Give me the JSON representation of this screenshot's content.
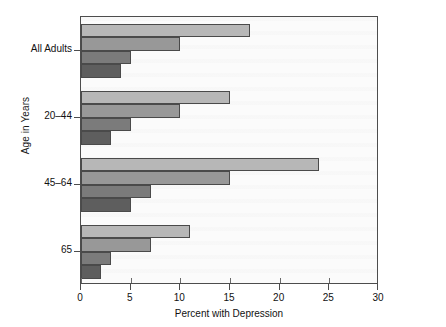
{
  "chart_data": {
    "type": "bar",
    "orientation": "horizontal",
    "title": "",
    "xlabel": "Percent with Depression",
    "ylabel": "Age in Years",
    "xlim": [
      0,
      30
    ],
    "xticks": [
      0,
      5,
      10,
      15,
      20,
      25,
      30
    ],
    "grid": false,
    "legend_title": "Poverty Level",
    "legend_position": "top-right inside plot",
    "categories": [
      "All Adults",
      "20–44",
      "45–64",
      "65"
    ],
    "series": [
      {
        "name": "Below 100%",
        "color": "#b7b7b7",
        "values": [
          17,
          15,
          24,
          11
        ]
      },
      {
        "name": "100%–199%",
        "color": "#989898",
        "values": [
          10,
          10,
          15,
          7
        ]
      },
      {
        "name": "200%–399%",
        "color": "#7b7b7b",
        "values": [
          5,
          5,
          7,
          3
        ]
      },
      {
        "name": "400%+",
        "color": "#5e5e5e",
        "values": [
          4,
          3,
          5,
          2
        ]
      }
    ]
  },
  "axes": {
    "x_label": "Percent with Depression",
    "y_label": "Age in Years",
    "x_tick_labels": [
      "0",
      "5",
      "10",
      "15",
      "20",
      "25",
      "30"
    ],
    "y_tick_labels": [
      "All Adults",
      "20–44",
      "45–64",
      "65"
    ]
  },
  "legend": {
    "title": "Poverty Level",
    "items": [
      {
        "label": "Below 100%",
        "color": "#b7b7b7"
      },
      {
        "label": "100%–199%",
        "color": "#989898"
      },
      {
        "label": "200%–399%",
        "color": "#7b7b7b"
      },
      {
        "label": "400%+",
        "color": "#5e5e5e"
      }
    ]
  },
  "style": {
    "plot_background": "#fbfbfb",
    "frame_color": "#4d4d4d",
    "text_color": "#111111"
  }
}
